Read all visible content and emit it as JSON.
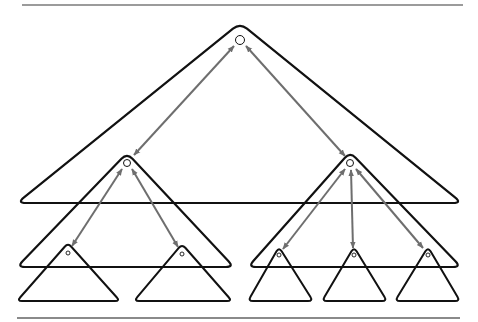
{
  "diagram": {
    "colors": {
      "triangle_stroke": "#111111",
      "arrow_stroke": "#6e6e6e",
      "rule_top": "#7a7a7a",
      "rule_bottom": "#8a8a8a",
      "background": "#ffffff"
    },
    "rules": [
      {
        "id": "top-rule",
        "x1": 22,
        "x2": 463,
        "y": 5,
        "width": 1.6
      },
      {
        "id": "bottom-rule",
        "x1": 17,
        "x2": 460,
        "y": 318,
        "width": 2.2
      }
    ],
    "triangles": [
      {
        "id": "root",
        "level": 0,
        "apex": [
          240,
          23
        ],
        "left": [
          17,
          203
        ],
        "right": [
          462,
          203
        ],
        "stroke_width": 2.2
      },
      {
        "id": "mid-left",
        "level": 1,
        "apex": [
          127,
          153
        ],
        "left": [
          17,
          267
        ],
        "right": [
          234,
          267
        ],
        "stroke_width": 2.2
      },
      {
        "id": "mid-right",
        "level": 1,
        "apex": [
          350,
          152
        ],
        "left": [
          248,
          267
        ],
        "right": [
          461,
          267
        ],
        "stroke_width": 2.2
      },
      {
        "id": "leaf-1",
        "level": 2,
        "apex": [
          68,
          243
        ],
        "left": [
          17,
          301
        ],
        "right": [
          120,
          301
        ],
        "stroke_width": 2.0
      },
      {
        "id": "leaf-2",
        "level": 2,
        "apex": [
          182,
          244
        ],
        "left": [
          134,
          301
        ],
        "right": [
          232,
          301
        ],
        "stroke_width": 2.0
      },
      {
        "id": "leaf-3",
        "level": 2,
        "apex": [
          279,
          247
        ],
        "left": [
          248,
          301
        ],
        "right": [
          313,
          301
        ],
        "stroke_width": 2.0
      },
      {
        "id": "leaf-4",
        "level": 2,
        "apex": [
          354,
          247
        ],
        "left": [
          322,
          301
        ],
        "right": [
          387,
          301
        ],
        "stroke_width": 2.0
      },
      {
        "id": "leaf-5",
        "level": 2,
        "apex": [
          428,
          247
        ],
        "left": [
          395,
          301
        ],
        "right": [
          460,
          301
        ],
        "stroke_width": 2.0
      }
    ],
    "nodes": [
      {
        "id": "root-node",
        "cx": 240,
        "cy": 40,
        "r": 4.5
      },
      {
        "id": "mid-left-node",
        "cx": 127,
        "cy": 163,
        "r": 3.5
      },
      {
        "id": "mid-right-node",
        "cx": 350,
        "cy": 163,
        "r": 3.5
      },
      {
        "id": "leaf-1-node",
        "cx": 68,
        "cy": 253,
        "r": 2
      },
      {
        "id": "leaf-2-node",
        "cx": 182,
        "cy": 254,
        "r": 2
      },
      {
        "id": "leaf-3-node",
        "cx": 279,
        "cy": 255,
        "r": 2
      },
      {
        "id": "leaf-4-node",
        "cx": 354,
        "cy": 255,
        "r": 2
      },
      {
        "id": "leaf-5-node",
        "cx": 428,
        "cy": 255,
        "r": 2
      }
    ],
    "edges": [
      {
        "id": "root-to-mid-left",
        "from": [
          234,
          46
        ],
        "to": [
          134,
          155
        ],
        "bidirectional": true
      },
      {
        "id": "root-to-mid-right",
        "from": [
          246,
          46
        ],
        "to": [
          345,
          156
        ],
        "bidirectional": true
      },
      {
        "id": "mid-left-to-leaf-1",
        "from": [
          122,
          169
        ],
        "to": [
          72,
          246
        ],
        "bidirectional": true
      },
      {
        "id": "mid-left-to-leaf-2",
        "from": [
          132,
          169
        ],
        "to": [
          178,
          247
        ],
        "bidirectional": true
      },
      {
        "id": "mid-right-to-leaf-3",
        "from": [
          345,
          169
        ],
        "to": [
          283,
          249
        ],
        "bidirectional": true
      },
      {
        "id": "mid-right-to-leaf-4",
        "from": [
          351,
          170
        ],
        "to": [
          353,
          248
        ],
        "bidirectional": true
      },
      {
        "id": "mid-right-to-leaf-5",
        "from": [
          356,
          169
        ],
        "to": [
          423,
          248
        ],
        "bidirectional": true
      }
    ]
  }
}
